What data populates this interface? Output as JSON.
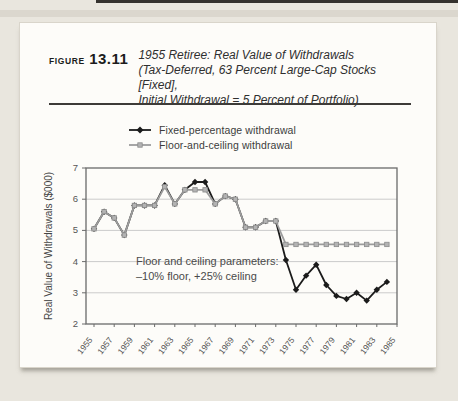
{
  "header": {
    "figure_label": "FIGURE",
    "figure_number": "13.11",
    "title_lines": [
      "1955 Retiree: Real Value of Withdrawals",
      "(Tax-Deferred, 63 Percent Large-Cap Stocks [Fixed],",
      "Initial Withdrawal = 5 Percent of Portfolio)"
    ]
  },
  "legend": [
    {
      "label": "Fixed-percentage withdrawal",
      "color": "#1b1b1b",
      "marker": "diamond"
    },
    {
      "label": "Floor-and-ceiling withdrawal",
      "color": "#9c9c9c",
      "marker": "square"
    }
  ],
  "colors": {
    "fixed_series": "#1b1b1b",
    "floor_series": "#9c9c9c",
    "frame": "#6a6a6a",
    "gridline": "#cbcbcb",
    "tick_text": "#555555",
    "annotation_text": "#4a4a4a"
  },
  "chart_data": {
    "type": "line",
    "title": "1955 Retiree: Real Value of Withdrawals",
    "xlabel": "",
    "ylabel": "Real Value of Withdrawals ($000)",
    "ylim": [
      2,
      7
    ],
    "yticks": [
      2,
      3,
      4,
      5,
      6,
      7
    ],
    "xticks": [
      1955,
      1957,
      1959,
      1961,
      1963,
      1965,
      1967,
      1969,
      1971,
      1973,
      1975,
      1977,
      1979,
      1981,
      1983,
      1985
    ],
    "grid": "horizontal",
    "legend_position": "top",
    "x": [
      1955,
      1956,
      1957,
      1958,
      1959,
      1960,
      1961,
      1962,
      1963,
      1964,
      1965,
      1966,
      1967,
      1968,
      1969,
      1970,
      1971,
      1972,
      1973,
      1974,
      1975,
      1976,
      1977,
      1978,
      1979,
      1980,
      1981,
      1982,
      1983,
      1984
    ],
    "series": [
      {
        "name": "Fixed-percentage withdrawal",
        "marker": "diamond",
        "values": [
          5.05,
          5.6,
          5.4,
          4.85,
          5.8,
          5.8,
          5.8,
          6.45,
          5.85,
          6.3,
          6.55,
          6.55,
          5.85,
          6.1,
          6.0,
          5.1,
          5.1,
          5.3,
          5.3,
          4.05,
          3.1,
          3.55,
          3.9,
          3.25,
          2.9,
          2.8,
          3.0,
          2.75,
          3.1,
          3.35
        ]
      },
      {
        "name": "Floor-and-ceiling withdrawal",
        "marker": "square",
        "values": [
          5.05,
          5.6,
          5.4,
          4.85,
          5.8,
          5.8,
          5.8,
          6.4,
          5.85,
          6.3,
          6.3,
          6.3,
          5.85,
          6.1,
          6.0,
          5.1,
          5.1,
          5.3,
          5.3,
          4.55,
          4.55,
          4.55,
          4.55,
          4.55,
          4.55,
          4.55,
          4.55,
          4.55,
          4.55,
          4.55
        ]
      }
    ],
    "annotation": {
      "lines": [
        "Floor and ceiling parameters:",
        "–10% floor, +25% ceiling"
      ]
    }
  }
}
